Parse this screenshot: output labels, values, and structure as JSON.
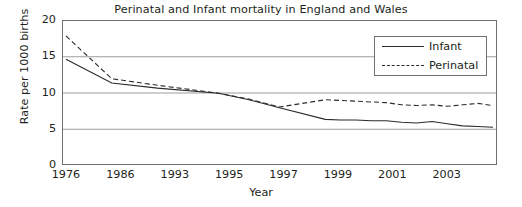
{
  "chart_data": {
    "type": "line",
    "title": "Perinatal and Infant mortality in England and Wales",
    "xlabel": "Year",
    "ylabel": "Rate per 1000 births",
    "ylim": [
      0,
      20
    ],
    "yticks": [
      0,
      5,
      10,
      15,
      20
    ],
    "xticks": [
      "1976",
      "1986",
      "1993",
      "1995",
      "1997",
      "1999",
      "2001",
      "2003"
    ],
    "grid": "horizontal",
    "legend_position": "top-right",
    "x": [
      1976,
      1979,
      1982,
      1986,
      1988,
      1990,
      1993,
      1994,
      1995,
      1996,
      1997,
      1998,
      1999,
      2000,
      2001,
      2002,
      2003,
      2004
    ],
    "series": [
      {
        "name": "Infant",
        "style": "solid",
        "color": "#2b2b2b",
        "values": [
          14.6,
          11.3,
          10.6,
          9.9,
          9.0,
          7.9,
          6.3,
          6.2,
          6.2,
          6.1,
          6.1,
          5.9,
          5.8,
          6.0,
          5.7,
          5.4,
          5.3,
          5.2
        ]
      },
      {
        "name": "Perinatal",
        "style": "dashed",
        "color": "#2b2b2b",
        "values": [
          17.8,
          11.9,
          11.0,
          9.9,
          9.1,
          8.0,
          9.0,
          8.9,
          8.8,
          8.7,
          8.6,
          8.3,
          8.2,
          8.3,
          8.1,
          8.3,
          8.5,
          8.2
        ]
      }
    ]
  },
  "legend": {
    "items": [
      {
        "label": "Infant"
      },
      {
        "label": "Perinatal"
      }
    ]
  }
}
